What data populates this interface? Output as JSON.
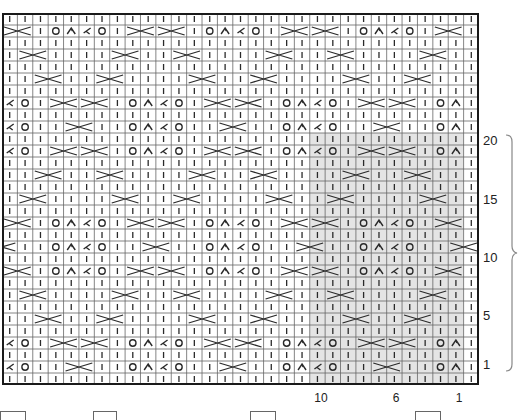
{
  "chart": {
    "type": "knitting-chart",
    "columns": 31,
    "rows_total": 31,
    "cell_width": 15.387,
    "cell_height": 12,
    "colors": {
      "grid_line": "#666666",
      "border": "#1a1a1a",
      "symbol": "#2a2a2a",
      "repeat_shade": "#e4e4e4",
      "background": "#ffffff"
    },
    "symbols": {
      "|": "knit-stitch",
      "O": "yarn-over",
      "^": "ssk-decrease",
      "<": "k2tog-decrease",
      "X": "cable-cross-2st",
      "x": "cable-cross-half"
    },
    "row_patterns": {
      "P": "|||||||||||||||||||||||||||||||",
      "A": "XX|O^<O|XXXX|O^<O|XXXX|O^<O|XX|",
      "B": "|XX||||XX||XX||||XX||XX||||XX||",
      "C": "||XX||XX||||XX||XX||||XX||XX|||",
      "D": "<O|XXXX|O^<O|XXXX|O^<O|XXXX|O^|",
      "E": "<O||XX||O^<O||XX||O^<O||XX||O^|",
      "F": "x||O^<O||XX||O^<O||XX||O^<O||XX"
    },
    "rows": [
      "P",
      "A",
      "P",
      "B",
      "P",
      "C",
      "P",
      "D",
      "P",
      "E",
      "P",
      "D",
      "P",
      "C",
      "P",
      "B",
      "P",
      "A",
      "P",
      "F",
      "P",
      "A",
      "P",
      "B",
      "P",
      "C",
      "P",
      "D",
      "P",
      "E",
      "P"
    ],
    "repeat_highlight": {
      "col_start": 20,
      "col_end": 29,
      "row_start": 10,
      "row_end": 30
    },
    "row_labels": [
      {
        "text": "20",
        "y": 134
      },
      {
        "text": "15",
        "y": 193
      },
      {
        "text": "10",
        "y": 251
      },
      {
        "text": "5",
        "y": 309
      },
      {
        "text": "1",
        "y": 358
      }
    ],
    "col_labels": [
      {
        "text": "10",
        "x": 321
      },
      {
        "text": "6",
        "x": 396
      },
      {
        "text": "1",
        "x": 459
      }
    ]
  },
  "legend": {
    "boxes": [
      {
        "x": 0,
        "w": 24
      },
      {
        "x": 93,
        "w": 22
      },
      {
        "x": 250,
        "w": 24
      },
      {
        "x": 415,
        "w": 24
      }
    ]
  }
}
